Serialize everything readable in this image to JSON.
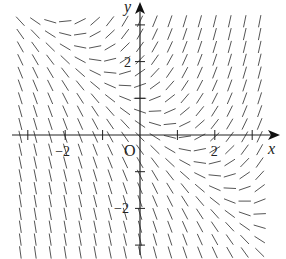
{
  "chart_data": {
    "type": "slope-field",
    "title": "",
    "xlabel": "x",
    "ylabel": "y",
    "origin_label": "O",
    "equation_estimate": "dy/dx = x + y - 1",
    "xlim": [
      -3.2,
      3.2
    ],
    "ylim": [
      -3.2,
      3.2
    ],
    "x_ticks": [
      -3,
      -2,
      -1,
      1,
      2,
      3
    ],
    "y_ticks": [
      -3,
      -2,
      -1,
      1,
      2,
      3
    ],
    "x_tick_labels": [
      {
        "value": -2,
        "label": "−2"
      },
      {
        "value": 2,
        "label": "2"
      }
    ],
    "y_tick_labels": [
      {
        "value": 2,
        "label": "2"
      },
      {
        "value": -2,
        "label": "−2"
      }
    ],
    "grid_step_x": 0.4,
    "grid_step_y": 0.35,
    "grid": false,
    "segment_color": "#555555",
    "axis_color": "#222222"
  }
}
